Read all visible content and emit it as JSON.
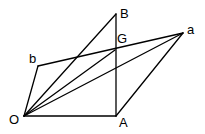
{
  "diagram": {
    "type": "vector-geometry",
    "stroke_color": "#000000",
    "background": "#ffffff",
    "points": {
      "O": {
        "label": "O",
        "x": 24,
        "y": 116,
        "lx": 9,
        "ly": 124
      },
      "A": {
        "label": "A",
        "x": 116,
        "y": 116,
        "lx": 119,
        "ly": 127
      },
      "B": {
        "label": "B",
        "x": 116,
        "y": 14,
        "lx": 120,
        "ly": 18
      },
      "G": {
        "label": "G",
        "x": 115,
        "y": 50,
        "lx": 117,
        "ly": 43
      },
      "a": {
        "label": "a",
        "x": 183,
        "y": 33,
        "lx": 187,
        "ly": 34
      },
      "b": {
        "label": "b",
        "x": 38,
        "y": 66,
        "lx": 29,
        "ly": 63
      }
    },
    "segments": [
      [
        "O",
        "A"
      ],
      [
        "A",
        "B"
      ],
      [
        "O",
        "B"
      ],
      [
        "O",
        "b"
      ],
      [
        "b",
        "a"
      ],
      [
        "O",
        "a"
      ],
      [
        "O",
        "G"
      ],
      [
        "A",
        "a"
      ]
    ]
  }
}
